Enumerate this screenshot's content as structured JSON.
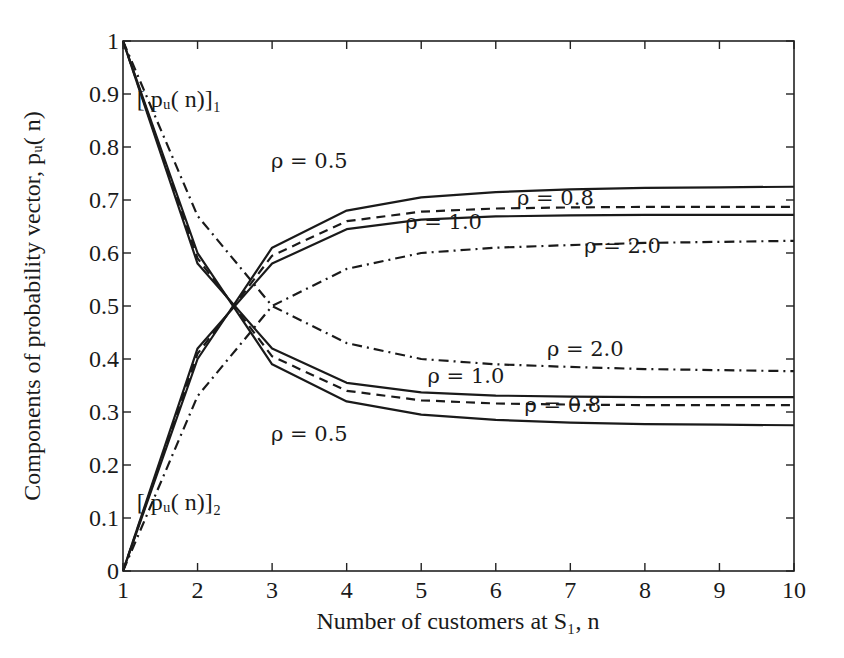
{
  "chart_data": {
    "type": "line",
    "title": "",
    "xlabel": "Number of customers at S₁, n",
    "ylabel": "Components of probability vector, pᵤ( n)",
    "xlim": [
      1,
      10
    ],
    "ylim": [
      0,
      1
    ],
    "grid": false,
    "legend": "inline annotations",
    "x": [
      1,
      2,
      3,
      4,
      5,
      6,
      7,
      8,
      9,
      10
    ],
    "xticks": [
      "1",
      "2",
      "3",
      "4",
      "5",
      "6",
      "7",
      "8",
      "9",
      "10"
    ],
    "yticks": [
      "0",
      "0.1",
      "0.2",
      "0.3",
      "0.4",
      "0.5",
      "0.6",
      "0.7",
      "0.8",
      "0.9",
      "1"
    ],
    "series": [
      {
        "name": "[p_u(n)]_1, ρ = 0.5",
        "component": 1,
        "rho": 0.5,
        "style": "solid",
        "values": [
          1.0,
          0.6,
          0.39,
          0.32,
          0.295,
          0.285,
          0.28,
          0.277,
          0.276,
          0.275
        ]
      },
      {
        "name": "[p_u(n)]_1, ρ = 0.8",
        "component": 1,
        "rho": 0.8,
        "style": "dashed",
        "values": [
          1.0,
          0.59,
          0.405,
          0.34,
          0.322,
          0.316,
          0.314,
          0.313,
          0.313,
          0.313
        ]
      },
      {
        "name": "[p_u(n)]_1, ρ = 1.0",
        "component": 1,
        "rho": 1.0,
        "style": "solid",
        "values": [
          1.0,
          0.58,
          0.42,
          0.355,
          0.337,
          0.331,
          0.329,
          0.328,
          0.328,
          0.328
        ]
      },
      {
        "name": "[p_u(n)]_1, ρ = 2.0",
        "component": 1,
        "rho": 2.0,
        "style": "dashdot",
        "values": [
          1.0,
          0.67,
          0.5,
          0.43,
          0.4,
          0.39,
          0.385,
          0.381,
          0.379,
          0.377
        ]
      },
      {
        "name": "[p_u(n)]_2, ρ = 0.5",
        "component": 2,
        "rho": 0.5,
        "style": "solid",
        "values": [
          0.0,
          0.4,
          0.61,
          0.68,
          0.705,
          0.715,
          0.72,
          0.723,
          0.724,
          0.725
        ]
      },
      {
        "name": "[p_u(n)]_2, ρ = 0.8",
        "component": 2,
        "rho": 0.8,
        "style": "dashed",
        "values": [
          0.0,
          0.41,
          0.595,
          0.66,
          0.678,
          0.684,
          0.686,
          0.687,
          0.687,
          0.687
        ]
      },
      {
        "name": "[p_u(n)]_2, ρ = 1.0",
        "component": 2,
        "rho": 1.0,
        "style": "solid",
        "values": [
          0.0,
          0.42,
          0.58,
          0.645,
          0.663,
          0.669,
          0.671,
          0.672,
          0.672,
          0.672
        ]
      },
      {
        "name": "[p_u(n)]_2, ρ = 2.0",
        "component": 2,
        "rho": 2.0,
        "style": "dashdot",
        "values": [
          0.0,
          0.33,
          0.5,
          0.57,
          0.6,
          0.61,
          0.615,
          0.619,
          0.621,
          0.623
        ]
      }
    ],
    "annotations": [
      {
        "text": "ρ = 0.5",
        "x": 3.5,
        "y": 0.76
      },
      {
        "text": "ρ = 0.8",
        "x": 6.8,
        "y": 0.69
      },
      {
        "text": "ρ = 1.0",
        "x": 5.3,
        "y": 0.645
      },
      {
        "text": "ρ = 2.0",
        "x": 7.7,
        "y": 0.6
      },
      {
        "text": "ρ = 2.0",
        "x": 7.2,
        "y": 0.405
      },
      {
        "text": "ρ = 1.0",
        "x": 5.6,
        "y": 0.355
      },
      {
        "text": "ρ = 0.8",
        "x": 6.9,
        "y": 0.3
      },
      {
        "text": "ρ = 0.5",
        "x": 3.5,
        "y": 0.245
      }
    ],
    "component_labels": [
      {
        "text": "[ pᵤ( n)]₁",
        "x": 1.75,
        "y": 0.875
      },
      {
        "text": "[ pᵤ( n)]₂",
        "x": 1.75,
        "y": 0.115
      }
    ]
  },
  "layout": {
    "plot_left": 123,
    "plot_top": 41,
    "plot_right": 794,
    "plot_bottom": 571
  }
}
